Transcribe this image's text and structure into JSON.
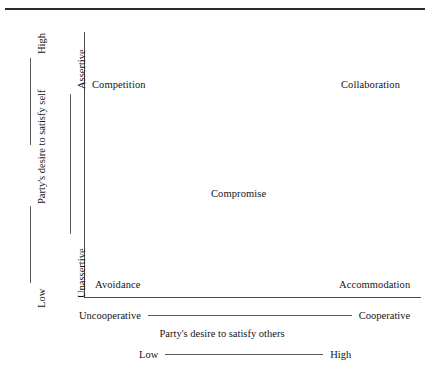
{
  "diagram": {
    "title_rule": "top-horizontal-rule",
    "vertical_axis": {
      "inner_scale": {
        "high_end": "Assertive",
        "low_end": "Unassertive"
      },
      "outer_scale": {
        "high_end": "High",
        "label": "Party's desire to satisfy self",
        "low_end": "Low"
      }
    },
    "horizontal_axis": {
      "inner_scale": {
        "low_end": "Uncooperative",
        "high_end": "Cooperative"
      },
      "label": "Party's desire to satisfy others",
      "outer_scale": {
        "low_end": "Low",
        "high_end": "High"
      }
    },
    "quadrants": [
      {
        "key": "competition",
        "label": "Competition",
        "position": "top-left"
      },
      {
        "key": "collaboration",
        "label": "Collaboration",
        "position": "top-right"
      },
      {
        "key": "compromise",
        "label": "Compromise",
        "position": "center"
      },
      {
        "key": "avoidance",
        "label": "Avoidance",
        "position": "bottom-left"
      },
      {
        "key": "accommodation",
        "label": "Accommodation",
        "position": "bottom-right"
      }
    ],
    "colors": {
      "rule": "#2b2b2b",
      "axis": "#4a4a4a",
      "text": "#141414",
      "background": "#ffffff"
    }
  }
}
